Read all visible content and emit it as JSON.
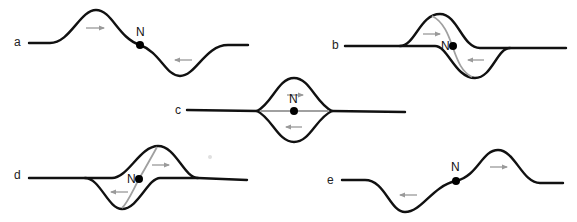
{
  "figure": {
    "point_label": "N",
    "colors": {
      "curve": "#111111",
      "arrow": "#9a9a9a",
      "gray_curve": "#a0a0a0",
      "dot": "#000000"
    },
    "panels": [
      {
        "id": "a",
        "label": "a",
        "arrows": [
          "right (upper, left of N)",
          "left (lower, right of N)"
        ]
      },
      {
        "id": "b",
        "label": "b",
        "arrows": [
          "right (upper)",
          "left (lower)"
        ]
      },
      {
        "id": "c",
        "label": "c",
        "arrows": [
          "right (upper)",
          "left (lower)"
        ]
      },
      {
        "id": "d",
        "label": "d",
        "arrows": [
          "right (upper)",
          "left (lower)"
        ]
      },
      {
        "id": "e",
        "label": "e",
        "arrows": [
          "left (lower, left of N)",
          "right (upper, right of N)"
        ]
      }
    ]
  }
}
